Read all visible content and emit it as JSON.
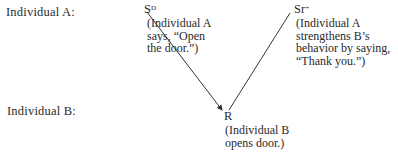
{
  "rows": {
    "a_label": "Individual A:",
    "b_label": "Individual B:"
  },
  "nodes": {
    "sd": {
      "symbol": "S",
      "superscript": "D",
      "caption": [
        "(Individual A",
        "says, “Open",
        "the door.”)"
      ]
    },
    "sr": {
      "symbol": "Sr",
      "superscript": "+",
      "caption": [
        "(Individual A",
        "strengthens B’s",
        "behavior by saying,",
        "“Thank you.”)"
      ]
    },
    "r": {
      "symbol": "R",
      "caption": [
        "(Individual B",
        "opens door.)"
      ]
    }
  },
  "colors": {
    "text": "#2a2a2a",
    "line": "#333333"
  }
}
